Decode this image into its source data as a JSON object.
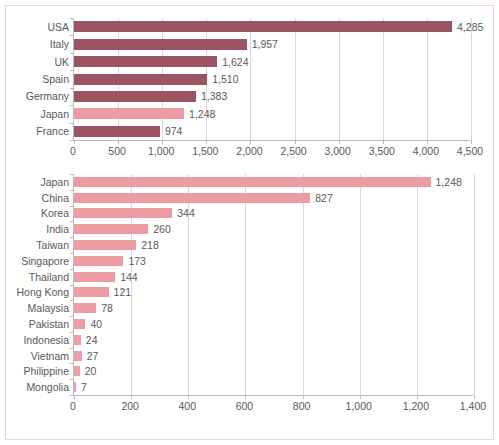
{
  "colors": {
    "bar_dark": "#9b5462",
    "bar_light": "#ee9ca4",
    "axis": "#b9babc",
    "grid": "#d8d9da",
    "text": "#58595b",
    "frame": "#f0d3d7",
    "background": "#ffffff"
  },
  "chart_data": [
    {
      "id": "top",
      "type": "bar",
      "orientation": "horizontal",
      "title": "",
      "xlabel": "",
      "ylabel": "",
      "xlim": [
        0,
        4500
      ],
      "xticks": [
        0,
        500,
        1000,
        1500,
        2000,
        2500,
        3000,
        3500,
        4000,
        4500
      ],
      "xticklabels": [
        "0",
        "500",
        "1,000",
        "1,500",
        "2,000",
        "2,500",
        "3,000",
        "3,500",
        "4,000",
        "4,500"
      ],
      "grid": true,
      "legend": "none",
      "categories": [
        "USA",
        "Italy",
        "UK",
        "Spain",
        "Germany",
        "Japan",
        "France"
      ],
      "values": [
        4285,
        1957,
        1624,
        1510,
        1383,
        1248,
        974
      ],
      "value_labels": [
        "4,285",
        "1,957",
        "1,624",
        "1,510",
        "1,383",
        "1,248",
        "974"
      ],
      "highlight": [
        "Japan"
      ]
    },
    {
      "id": "bottom",
      "type": "bar",
      "orientation": "horizontal",
      "title": "",
      "xlabel": "",
      "ylabel": "",
      "xlim": [
        0,
        1400
      ],
      "xticks": [
        0,
        200,
        400,
        600,
        800,
        1000,
        1200,
        1400
      ],
      "xticklabels": [
        "0",
        "200",
        "400",
        "600",
        "800",
        "1,000",
        "1,200",
        "1,400"
      ],
      "grid": true,
      "legend": "none",
      "categories": [
        "Japan",
        "China",
        "Korea",
        "India",
        "Taiwan",
        "Singapore",
        "Thailand",
        "Hong Kong",
        "Malaysia",
        "Pakistan",
        "Indonesia",
        "Vietnam",
        "Philippine",
        "Mongolia"
      ],
      "values": [
        1248,
        827,
        344,
        260,
        218,
        173,
        144,
        121,
        78,
        40,
        24,
        27,
        20,
        7
      ],
      "value_labels": [
        "1,248",
        "827",
        "344",
        "260",
        "218",
        "173",
        "144",
        "121",
        "78",
        "40",
        "24",
        "27",
        "20",
        "7"
      ],
      "highlight": []
    }
  ]
}
